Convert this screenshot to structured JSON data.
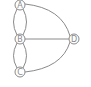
{
  "diagram": {
    "type": "graph",
    "nodes": [
      {
        "id": "A",
        "label": "A",
        "x": 20,
        "y": 5
      },
      {
        "id": "B",
        "label": "B",
        "x": 20,
        "y": 39
      },
      {
        "id": "C",
        "label": "C",
        "x": 20,
        "y": 72
      },
      {
        "id": "D",
        "label": "D",
        "x": 74,
        "y": 39
      }
    ],
    "edges": [
      {
        "from": "A",
        "to": "B",
        "count": 2
      },
      {
        "from": "B",
        "to": "C",
        "count": 2
      },
      {
        "from": "A",
        "to": "D",
        "count": 1
      },
      {
        "from": "B",
        "to": "D",
        "count": 1
      },
      {
        "from": "C",
        "to": "D",
        "count": 1
      }
    ],
    "colors": {
      "stroke": "#8a8a8a",
      "background": "#ffffff"
    }
  }
}
